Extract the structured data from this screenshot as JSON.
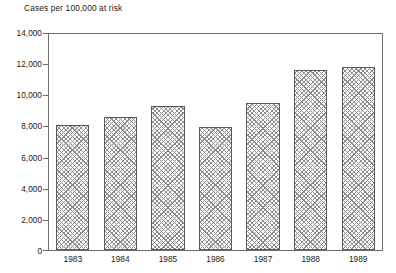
{
  "chart_data": {
    "type": "bar",
    "title": "Cases per 100,000 at risk",
    "xlabel": "",
    "ylabel": "",
    "categories": [
      "1983",
      "1984",
      "1985",
      "1986",
      "1987",
      "1988",
      "1989"
    ],
    "values": [
      8100,
      8650,
      9350,
      7950,
      9550,
      11700,
      11850
    ],
    "ylim": [
      0,
      14000
    ],
    "ytick_values": [
      0,
      2000,
      4000,
      6000,
      8000,
      10000,
      12000,
      14000
    ],
    "ytick_labels": [
      "0",
      "2,000",
      "4,000",
      "6,000",
      "8,000",
      "10,000",
      "12,000",
      "14,000"
    ],
    "grid": false,
    "legend": null,
    "bar_style": {
      "fill": "cross-hatch",
      "hatch_color": "#8d8d8d",
      "background_color": "#ffffff",
      "edge_color": "#5a5a5a"
    },
    "frame_color": "#6e6e6e"
  }
}
